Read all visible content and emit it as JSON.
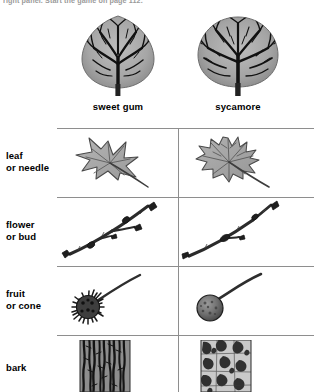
{
  "caption": {
    "text": "right panel. Start the game on page 112."
  },
  "header": {
    "columns": [
      {
        "label": "sweet gum",
        "icon": "tree-oval-crown-icon"
      },
      {
        "label": "sycamore",
        "icon": "tree-round-crown-icon"
      }
    ]
  },
  "rows": [
    {
      "label_line1": "leaf",
      "label_line2": "or needle",
      "cells": [
        {
          "icon": "sweetgum-star-leaf-icon"
        },
        {
          "icon": "sycamore-lobed-leaf-icon"
        }
      ]
    },
    {
      "label_line1": "flower",
      "label_line2": "or bud",
      "cells": [
        {
          "icon": "sweetgum-forked-twig-bud-icon"
        },
        {
          "icon": "sycamore-straight-twig-bud-icon"
        }
      ]
    },
    {
      "label_line1": "fruit",
      "label_line2": "or cone",
      "cells": [
        {
          "icon": "sweetgum-spiky-gumball-fruit-icon"
        },
        {
          "icon": "sycamore-smooth-ball-fruit-icon"
        }
      ]
    },
    {
      "label_line1": "bark",
      "label_line2": "",
      "cells": [
        {
          "icon": "sweetgum-furrowed-bark-icon"
        },
        {
          "icon": "sycamore-mottled-bark-icon"
        }
      ]
    }
  ],
  "colors": {
    "rule": "#8e8e8e",
    "ink": "#000000",
    "caption": "#9a9a9a",
    "leaf_fill": "#a8a8a8",
    "bark_dark": "#3a3a3a",
    "bark_light": "#c9c9c9"
  }
}
